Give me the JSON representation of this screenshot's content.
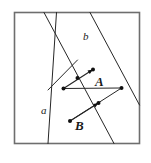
{
  "figure": {
    "type": "geometry-diagram",
    "canvas": {
      "width": 151,
      "height": 163
    },
    "colors": {
      "background": "#ffffff",
      "frame_stroke": "#6e6e6e",
      "line_stroke": "#262626",
      "point_fill": "#111111",
      "label_color": "#1a1a1a"
    },
    "frame": {
      "name": "bounding-square",
      "x": 14.5,
      "y": 12.5,
      "width": 125,
      "height": 131,
      "stroke_width": 1.6
    },
    "lines": [
      {
        "name": "line-a",
        "label": "a",
        "label_x": 41,
        "label_y": 105,
        "x1": 56.5,
        "y1": 12.5,
        "x2": 48.0,
        "y2": 143.5,
        "stroke_width": 1.0
      },
      {
        "name": "line-b",
        "label": "b",
        "label_x": 83,
        "label_y": 31,
        "x1": 44.0,
        "y1": 12.5,
        "x2": 114.0,
        "y2": 143.5,
        "stroke_width": 1.0
      },
      {
        "name": "transversal-upper",
        "label": "",
        "x1": 90.0,
        "y1": 12.5,
        "x2": 139.5,
        "y2": 105.0,
        "stroke_width": 1.0
      },
      {
        "name": "segment-left-upper",
        "label": "",
        "x1": 77.5,
        "y1": 60.0,
        "x2": 48.0,
        "y2": 90.0,
        "stroke_width": 1.0
      },
      {
        "name": "segment-parallel-upper",
        "label": "",
        "x1": 63.5,
        "y1": 88.5,
        "x2": 121.5,
        "y2": 88.0,
        "stroke_width": 1.0
      },
      {
        "name": "segment-parallel-lower",
        "label": "",
        "x1": 70.0,
        "y1": 121.0,
        "x2": 121.5,
        "y2": 88.0,
        "stroke_width": 1.0
      }
    ],
    "vectors": [
      {
        "name": "vector-A",
        "label": "A",
        "label_x": 95,
        "label_y": 75,
        "tail_x": 63.5,
        "tail_y": 88.5,
        "tip_x": 93.0,
        "tip_y": 69.5,
        "stroke_width": 1.2
      },
      {
        "name": "vector-B",
        "label": "B",
        "label_x": 75,
        "label_y": 119,
        "tail_x": 70.0,
        "tail_y": 121.0,
        "tip_x": 98.5,
        "tip_y": 103.0,
        "stroke_width": 1.2
      }
    ],
    "points": [
      {
        "name": "point-vector-A-tip",
        "x": 93.0,
        "y": 69.5,
        "r": 2.0
      },
      {
        "name": "point-vector-A-tail",
        "x": 63.5,
        "y": 88.5,
        "r": 2.0
      },
      {
        "name": "point-intersection-upper",
        "x": 77.5,
        "y": 78.0,
        "r": 2.0
      },
      {
        "name": "point-right-upper",
        "x": 121.5,
        "y": 88.0,
        "r": 2.0
      },
      {
        "name": "point-vector-B-tip",
        "x": 98.5,
        "y": 103.0,
        "r": 2.0
      },
      {
        "name": "point-vector-B-tail",
        "x": 70.0,
        "y": 121.0,
        "r": 2.0
      }
    ]
  }
}
